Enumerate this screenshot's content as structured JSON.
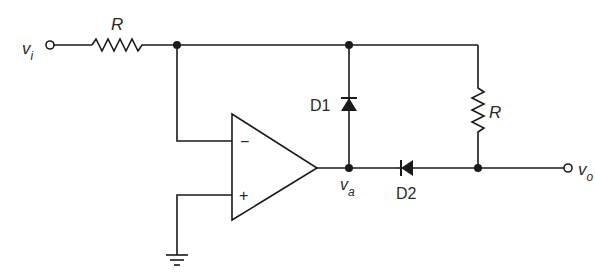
{
  "diagram": {
    "type": "circuit-schematic",
    "colors": {
      "line": "#1a1a1a",
      "label": "#2a2a2a",
      "background": "#ffffff"
    },
    "terminals": {
      "input": {
        "symbol": "v",
        "subscript": "i"
      },
      "output": {
        "symbol": "v",
        "subscript": "o"
      },
      "opamp_output_node": {
        "symbol": "v",
        "subscript": "a"
      }
    },
    "components": {
      "input_resistor": {
        "label": "R"
      },
      "feedback_resistor": {
        "label": "R"
      },
      "diode_1": {
        "label": "D1"
      },
      "diode_2": {
        "label": "D2"
      },
      "opamp": {
        "inverting_label": "−",
        "noninverting_label": "+"
      },
      "ground": {
        "label": ""
      }
    }
  }
}
